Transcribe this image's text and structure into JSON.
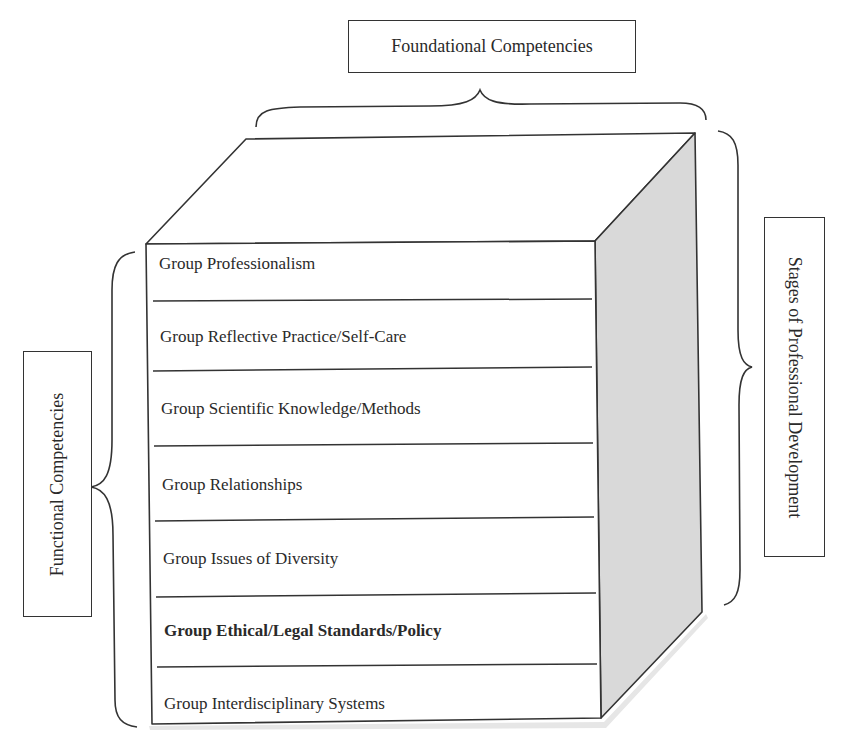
{
  "diagram": {
    "top_label": "Foundational Competencies",
    "left_label": "Functional Competencies",
    "right_label": "Stages of Professional Development",
    "rows": [
      {
        "label": "Group Professionalism",
        "bold": false
      },
      {
        "label": "Group Reflective Practice/Self-Care",
        "bold": false
      },
      {
        "label": "Group Scientific Knowledge/Methods",
        "bold": false
      },
      {
        "label": "Group Relationships",
        "bold": false
      },
      {
        "label": "Group Issues of Diversity",
        "bold": false
      },
      {
        "label": "Group Ethical/Legal Standards/Policy",
        "bold": true
      },
      {
        "label": "Group Interdisciplinary Systems",
        "bold": false
      }
    ],
    "colors": {
      "stroke": "#333333",
      "side_face": "#d9d9d9",
      "background": "#ffffff"
    }
  }
}
